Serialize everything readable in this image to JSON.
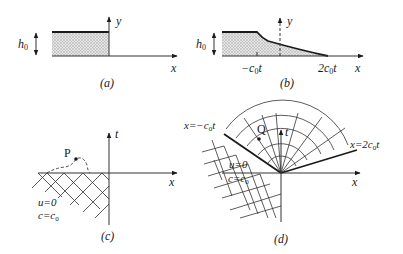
{
  "figure": {
    "panels": [
      {
        "id": "a",
        "caption": "(a)",
        "labels": {
          "height": "h",
          "height_sub": "0",
          "y_axis": "y",
          "x_axis": "x"
        },
        "description": "Initial dam: uniform water depth h0 for x<0, dry for x>0"
      },
      {
        "id": "b",
        "caption": "(b)",
        "labels": {
          "height": "h",
          "height_sub": "0",
          "y_axis": "y",
          "x_axis": "x",
          "left_tick": "−c",
          "left_tick_sub": "0",
          "left_tick_suffix": "t",
          "right_tick": "2c",
          "right_tick_sub": "0",
          "right_tick_suffix": "t"
        },
        "description": "Depth profile after dam break: flat h0 until -c0t, then curved decrease to zero at 2c0t"
      },
      {
        "id": "c",
        "caption": "(c)",
        "labels": {
          "t_axis": "t",
          "x_axis": "x",
          "point": "P",
          "state_u": "u=0",
          "state_c": "c=c",
          "state_c_sub": "0"
        },
        "description": "Characteristic grid in undisturbed region; dashed path to point P"
      },
      {
        "id": "d",
        "caption": "(d)",
        "labels": {
          "t_axis": "t",
          "x_axis": "x",
          "point": "Q",
          "left_line": "x=−c",
          "left_line_sub": "0",
          "left_line_suffix": "t",
          "right_line": "x=2c",
          "right_line_sub": "0",
          "right_line_suffix": "t",
          "state_u": "u=0",
          "state_c": "c=c",
          "state_c_sub": "0"
        },
        "description": "Centered expansion fan between x=-c0t and x=2c0t with characteristic grid"
      }
    ],
    "colors": {
      "ink": "#1a1a1a",
      "shade": "#d4d4d4"
    }
  }
}
